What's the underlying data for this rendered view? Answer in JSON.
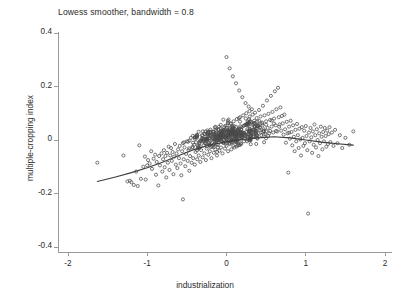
{
  "chart_data": {
    "type": "scatter",
    "title": "Lowess smoother, bandwidth = 0.8",
    "xlabel": "industrialization",
    "ylabel": "multiple-cropping index",
    "xlim": [
      -2,
      2
    ],
    "ylim": [
      -0.4,
      0.4
    ],
    "xticks": [
      -2,
      -1,
      0,
      1,
      2
    ],
    "xticklabels": [
      "-2",
      "-1",
      "0",
      "1",
      "2"
    ],
    "yticks": [
      0.4,
      0.2,
      0,
      -0.2,
      -0.4
    ],
    "yticklabels": [
      "0.4",
      "0.2",
      "0",
      "-0.2",
      "-0.4"
    ],
    "grid": false,
    "legend": null,
    "marker": {
      "shape": "open-circle",
      "size": 3.1,
      "color": "#4a4a4a",
      "fill": "none"
    },
    "series": [
      {
        "name": "observations",
        "type": "scatter",
        "n_points": 620,
        "points": [
          [
            -1.63,
            -0.085
          ],
          [
            -1.3,
            -0.058
          ],
          [
            -1.25,
            -0.155
          ],
          [
            -1.22,
            -0.152
          ],
          [
            -1.2,
            -0.158
          ],
          [
            -1.17,
            -0.168
          ],
          [
            -1.14,
            -0.118
          ],
          [
            -1.12,
            -0.172
          ],
          [
            -1.1,
            -0.02
          ],
          [
            -1.08,
            -0.145
          ],
          [
            -1.05,
            -0.1
          ],
          [
            -1.03,
            -0.062
          ],
          [
            -1.02,
            -0.148
          ],
          [
            -1.0,
            -0.095
          ],
          [
            -0.99,
            -0.075
          ],
          [
            -0.97,
            -0.088
          ],
          [
            -0.95,
            -0.042
          ],
          [
            -0.94,
            -0.108
          ],
          [
            -0.92,
            -0.07
          ],
          [
            -0.9,
            -0.055
          ],
          [
            -0.89,
            -0.13
          ],
          [
            -0.88,
            -0.082
          ],
          [
            -0.86,
            -0.17
          ],
          [
            -0.85,
            -0.06
          ],
          [
            -0.84,
            -0.095
          ],
          [
            -0.82,
            -0.05
          ],
          [
            -0.81,
            -0.118
          ],
          [
            -0.8,
            -0.072
          ],
          [
            -0.79,
            -0.038
          ],
          [
            -0.78,
            -0.102
          ],
          [
            -0.77,
            -0.06
          ],
          [
            -0.76,
            -0.14
          ],
          [
            -0.75,
            -0.048
          ],
          [
            -0.74,
            -0.085
          ],
          [
            -0.73,
            -0.025
          ],
          [
            -0.72,
            -0.112
          ],
          [
            -0.71,
            -0.058
          ],
          [
            -0.7,
            -0.03
          ],
          [
            -0.69,
            -0.078
          ],
          [
            -0.68,
            -0.045
          ],
          [
            -0.67,
            -0.128
          ],
          [
            -0.66,
            -0.062
          ],
          [
            -0.65,
            -0.015
          ],
          [
            -0.64,
            -0.092
          ],
          [
            -0.63,
            -0.05
          ],
          [
            -0.62,
            -0.105
          ],
          [
            -0.61,
            -0.035
          ],
          [
            -0.6,
            -0.068
          ],
          [
            -0.59,
            -0.022
          ],
          [
            -0.58,
            -0.088
          ],
          [
            -0.57,
            -0.132
          ],
          [
            -0.56,
            -0.042
          ],
          [
            -0.55,
            -0.222
          ],
          [
            -0.55,
            -0.012
          ],
          [
            -0.54,
            -0.072
          ],
          [
            -0.53,
            -0.028
          ],
          [
            -0.52,
            -0.098
          ],
          [
            -0.51,
            -0.052
          ],
          [
            -0.5,
            -0.005
          ],
          [
            -0.49,
            -0.078
          ],
          [
            -0.48,
            -0.038
          ],
          [
            -0.47,
            -0.115
          ],
          [
            -0.46,
            -0.06
          ],
          [
            -0.45,
            0.008
          ],
          [
            -0.44,
            -0.085
          ],
          [
            -0.43,
            -0.03
          ],
          [
            -0.42,
            -0.068
          ],
          [
            -0.41,
            -0.018
          ],
          [
            -0.4,
            -0.092
          ],
          [
            -0.39,
            -0.045
          ],
          [
            -0.38,
            0.012
          ],
          [
            -0.37,
            -0.072
          ],
          [
            -0.36,
            -0.025
          ],
          [
            -0.35,
            -0.058
          ],
          [
            -0.34,
            -0.008
          ],
          [
            -0.33,
            -0.082
          ],
          [
            -0.32,
            -0.038
          ],
          [
            -0.31,
            0.018
          ],
          [
            -0.3,
            -0.065
          ],
          [
            -0.29,
            -0.02
          ],
          [
            -0.28,
            -0.05
          ],
          [
            -0.27,
            0.005
          ],
          [
            -0.26,
            -0.075
          ],
          [
            -0.25,
            -0.032
          ],
          [
            -0.24,
            0.022
          ],
          [
            -0.23,
            -0.055
          ],
          [
            -0.22,
            -0.012
          ],
          [
            -0.21,
            -0.042
          ],
          [
            -0.2,
            0.015
          ],
          [
            -0.19,
            -0.068
          ],
          [
            -0.18,
            -0.025
          ],
          [
            -0.17,
            0.03
          ],
          [
            -0.16,
            -0.048
          ],
          [
            -0.15,
            -0.005
          ],
          [
            -0.14,
            -0.035
          ],
          [
            -0.13,
            0.025
          ],
          [
            -0.12,
            -0.058
          ],
          [
            -0.11,
            -0.018
          ],
          [
            -0.1,
            0.04
          ],
          [
            -0.09,
            -0.04
          ],
          [
            -0.08,
            0.002
          ],
          [
            -0.07,
            -0.028
          ],
          [
            -0.06,
            0.035
          ],
          [
            -0.05,
            -0.05
          ],
          [
            -0.04,
            -0.01
          ],
          [
            -0.03,
            0.048
          ],
          [
            -0.02,
            -0.032
          ],
          [
            -0.01,
            0.008
          ],
          [
            0.0,
            0.31
          ],
          [
            0.0,
            -0.022
          ],
          [
            0.01,
            0.055
          ],
          [
            0.02,
            -0.042
          ],
          [
            0.03,
            0.012
          ],
          [
            0.04,
            0.268
          ],
          [
            0.04,
            -0.015
          ],
          [
            0.05,
            0.062
          ],
          [
            0.06,
            -0.035
          ],
          [
            0.07,
            0.02
          ],
          [
            0.08,
            0.238
          ],
          [
            0.08,
            -0.008
          ],
          [
            0.09,
            0.07
          ],
          [
            0.1,
            -0.028
          ],
          [
            0.11,
            0.03
          ],
          [
            0.12,
            0.212
          ],
          [
            0.12,
            -0.002
          ],
          [
            0.13,
            0.078
          ],
          [
            0.14,
            -0.02
          ],
          [
            0.15,
            0.04
          ],
          [
            0.16,
            0.185
          ],
          [
            0.16,
            0.005
          ],
          [
            0.17,
            0.085
          ],
          [
            0.18,
            -0.012
          ],
          [
            0.19,
            0.048
          ],
          [
            0.2,
            0.16
          ],
          [
            0.2,
            0.012
          ],
          [
            0.21,
            0.092
          ],
          [
            0.22,
            -0.005
          ],
          [
            0.23,
            0.055
          ],
          [
            0.24,
            0.138
          ],
          [
            0.24,
            0.018
          ],
          [
            0.25,
            0.1
          ],
          [
            0.26,
            0.002
          ],
          [
            0.27,
            0.062
          ],
          [
            0.28,
            0.125
          ],
          [
            0.28,
            0.022
          ],
          [
            0.29,
            0.108
          ],
          [
            0.3,
            0.008
          ],
          [
            0.31,
            0.068
          ],
          [
            0.32,
            0.115
          ],
          [
            0.32,
            0.028
          ],
          [
            0.33,
            0.095
          ],
          [
            0.34,
            0.012
          ],
          [
            0.35,
            0.072
          ],
          [
            0.36,
            0.102
          ],
          [
            0.37,
            0.032
          ],
          [
            0.38,
            0.082
          ],
          [
            0.39,
            0.015
          ],
          [
            0.4,
            0.058
          ],
          [
            0.41,
            0.112
          ],
          [
            0.42,
            0.035
          ],
          [
            0.43,
            0.088
          ],
          [
            0.44,
            0.018
          ],
          [
            0.45,
            0.065
          ],
          [
            0.46,
            0.128
          ],
          [
            0.47,
            0.04
          ],
          [
            0.48,
            0.092
          ],
          [
            0.49,
            0.022
          ],
          [
            0.5,
            0.07
          ],
          [
            0.51,
            0.148
          ],
          [
            0.52,
            0.045
          ],
          [
            0.53,
            0.098
          ],
          [
            0.54,
            0.025
          ],
          [
            0.55,
            0.075
          ],
          [
            0.56,
            0.165
          ],
          [
            0.57,
            0.05
          ],
          [
            0.58,
            0.105
          ],
          [
            0.59,
            0.028
          ],
          [
            0.6,
            0.08
          ],
          [
            0.61,
            0.182
          ],
          [
            0.62,
            0.055
          ],
          [
            0.63,
            0.115
          ],
          [
            0.64,
            0.032
          ],
          [
            0.65,
            0.195
          ],
          [
            0.66,
            0.085
          ],
          [
            0.67,
            0.058
          ],
          [
            0.68,
            0.122
          ],
          [
            0.69,
            0.035
          ],
          [
            0.7,
            0.09
          ],
          [
            0.71,
            0.062
          ],
          [
            0.72,
            0.02
          ],
          [
            0.73,
            0.095
          ],
          [
            0.74,
            0.04
          ],
          [
            0.75,
            -0.01
          ],
          [
            0.76,
            0.068
          ],
          [
            0.77,
            0.025
          ],
          [
            0.78,
            -0.122
          ],
          [
            0.79,
            0.05
          ],
          [
            0.8,
            0.005
          ],
          [
            0.81,
            0.072
          ],
          [
            0.82,
            0.03
          ],
          [
            0.83,
            -0.02
          ],
          [
            0.84,
            0.055
          ],
          [
            0.85,
            0.012
          ],
          [
            0.86,
            -0.042
          ],
          [
            0.87,
            0.038
          ],
          [
            0.88,
            -0.005
          ],
          [
            0.89,
            0.06
          ],
          [
            0.9,
            0.018
          ],
          [
            0.91,
            -0.03
          ],
          [
            0.92,
            0.042
          ],
          [
            0.93,
            0.002
          ],
          [
            0.94,
            -0.058
          ],
          [
            0.95,
            0.048
          ],
          [
            0.96,
            0.008
          ],
          [
            0.97,
            -0.022
          ],
          [
            0.98,
            0.035
          ],
          [
            0.99,
            -0.012
          ],
          [
            1.0,
            0.052
          ],
          [
            1.01,
            0.015
          ],
          [
            1.02,
            -0.038
          ],
          [
            1.03,
            -0.275
          ],
          [
            1.04,
            0.028
          ],
          [
            1.05,
            -0.005
          ],
          [
            1.06,
            0.045
          ],
          [
            1.07,
            0.01
          ],
          [
            1.08,
            -0.048
          ],
          [
            1.09,
            0.032
          ],
          [
            1.1,
            -0.018
          ],
          [
            1.11,
            0.058
          ],
          [
            1.12,
            0.018
          ],
          [
            1.13,
            -0.028
          ],
          [
            1.14,
            0.04
          ],
          [
            1.15,
            0.0
          ],
          [
            1.16,
            -0.06
          ],
          [
            1.17,
            0.025
          ],
          [
            1.18,
            -0.012
          ],
          [
            1.19,
            0.05
          ],
          [
            1.2,
            0.012
          ],
          [
            1.21,
            -0.035
          ],
          [
            1.22,
            0.03
          ],
          [
            1.23,
            -0.005
          ],
          [
            1.24,
            0.045
          ],
          [
            1.25,
            0.015
          ],
          [
            1.26,
            -0.025
          ],
          [
            1.27,
            0.035
          ],
          [
            1.28,
            -0.015
          ],
          [
            1.29,
            0.022
          ],
          [
            1.3,
            0.048
          ],
          [
            1.31,
            -0.008
          ],
          [
            1.33,
            0.028
          ],
          [
            1.35,
            -0.022
          ],
          [
            1.37,
            0.038
          ],
          [
            1.4,
            -0.012
          ],
          [
            1.43,
            0.018
          ],
          [
            1.46,
            -0.03
          ],
          [
            1.5,
            0.008
          ],
          [
            1.55,
            -0.018
          ],
          [
            1.6,
            0.032
          ]
        ]
      },
      {
        "name": "lowess smooth",
        "type": "line",
        "color": "#3c3c3c",
        "points": [
          [
            -1.63,
            -0.155
          ],
          [
            -1.4,
            -0.138
          ],
          [
            -1.2,
            -0.122
          ],
          [
            -1.0,
            -0.104
          ],
          [
            -0.8,
            -0.082
          ],
          [
            -0.6,
            -0.058
          ],
          [
            -0.4,
            -0.035
          ],
          [
            -0.2,
            -0.018
          ],
          [
            0.0,
            -0.006
          ],
          [
            0.2,
            0.002
          ],
          [
            0.4,
            0.008
          ],
          [
            0.6,
            0.012
          ],
          [
            0.8,
            0.008
          ],
          [
            1.0,
            0.0
          ],
          [
            1.2,
            -0.008
          ],
          [
            1.4,
            -0.014
          ],
          [
            1.6,
            -0.019
          ]
        ]
      }
    ]
  },
  "colors": {
    "axis": "#9a9a9a",
    "text": "#2b2b2b",
    "marker": "#4a4a4a",
    "smoother": "#3c3c3c",
    "background": "#ffffff"
  }
}
